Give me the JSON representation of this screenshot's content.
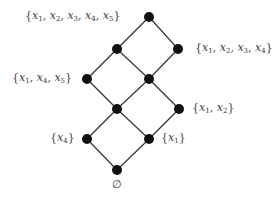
{
  "diagram": {
    "type": "lattice",
    "nodes": [
      {
        "id": "top",
        "x": 149,
        "y": 17,
        "label": "{x1, x2, x3, x4, x5}",
        "label_parts": [
          [
            "x",
            "1"
          ],
          [
            "x",
            "2"
          ],
          [
            "x",
            "3"
          ],
          [
            "x",
            "4"
          ],
          [
            "x",
            "5"
          ]
        ],
        "label_side": "left",
        "label_x": 25
      },
      {
        "id": "a",
        "x": 117,
        "y": 49,
        "label": "",
        "label_parts": null
      },
      {
        "id": "b",
        "x": 178,
        "y": 49,
        "label": "{x1, x2, x3, x4}",
        "label_parts": [
          [
            "x",
            "1"
          ],
          [
            "x",
            "2"
          ],
          [
            "x",
            "3"
          ],
          [
            "x",
            "4"
          ]
        ],
        "label_side": "right",
        "label_x": 195
      },
      {
        "id": "c",
        "x": 87,
        "y": 79,
        "label": "{x1, x4, x5}",
        "label_parts": [
          [
            "x",
            "1"
          ],
          [
            "x",
            "4"
          ],
          [
            "x",
            "5"
          ]
        ],
        "label_side": "left",
        "label_x": 12
      },
      {
        "id": "d",
        "x": 149,
        "y": 79,
        "label": "",
        "label_parts": null
      },
      {
        "id": "e",
        "x": 117,
        "y": 109,
        "label": "",
        "label_parts": null
      },
      {
        "id": "f",
        "x": 179,
        "y": 109,
        "label": "{x1, x2}",
        "label_parts": [
          [
            "x",
            "1"
          ],
          [
            "x",
            "2"
          ]
        ],
        "label_side": "right",
        "label_x": 192
      },
      {
        "id": "g",
        "x": 87,
        "y": 139,
        "label": "{x4}",
        "label_parts": [
          [
            "x",
            "4"
          ]
        ],
        "label_side": "left",
        "label_x": 50
      },
      {
        "id": "h",
        "x": 149,
        "y": 139,
        "label": "{x1}",
        "label_parts": [
          [
            "x",
            "1"
          ]
        ],
        "label_side": "right",
        "label_x": 161
      },
      {
        "id": "bottom",
        "x": 117,
        "y": 170,
        "label": "∅",
        "label_parts": null,
        "label_side": "below",
        "label_x": 112
      }
    ],
    "edges": [
      [
        "top",
        "a"
      ],
      [
        "top",
        "b"
      ],
      [
        "a",
        "c"
      ],
      [
        "a",
        "d"
      ],
      [
        "b",
        "d"
      ],
      [
        "c",
        "e"
      ],
      [
        "d",
        "e"
      ],
      [
        "d",
        "f"
      ],
      [
        "e",
        "g"
      ],
      [
        "e",
        "h"
      ],
      [
        "f",
        "h"
      ],
      [
        "g",
        "bottom"
      ],
      [
        "h",
        "bottom"
      ]
    ],
    "empty_set_symbol": "∅",
    "colors": {
      "node": "#111111",
      "edge": "#333333",
      "label": "#3a3a3a",
      "background": "#ffffff"
    },
    "node_radius": 5
  }
}
